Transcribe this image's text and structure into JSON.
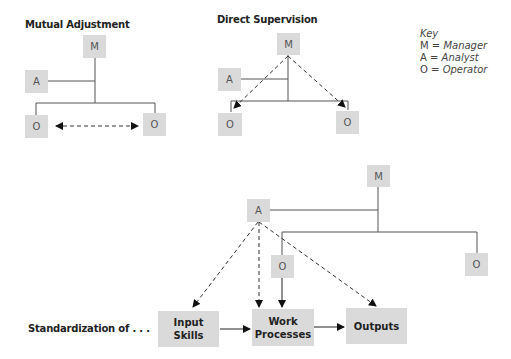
{
  "panels": {
    "mutual_adjustment": {
      "title": "Mutual Adjustment",
      "nodes": {
        "manager": "M",
        "analyst": "A",
        "operator_left": "O",
        "operator_right": "O"
      }
    },
    "direct_supervision": {
      "title": "Direct Supervision",
      "nodes": {
        "manager": "M",
        "analyst": "A",
        "operator_left": "O",
        "operator_right": "O"
      }
    },
    "standardization": {
      "label": "Standardization of . . .",
      "nodes": {
        "manager": "M",
        "analyst": "A",
        "operator_left": "O",
        "operator_right": "O"
      },
      "stages": {
        "input_skills": [
          "Input",
          "Skills"
        ],
        "work_processes": [
          "Work",
          "Processes"
        ],
        "outputs": "Outputs"
      }
    }
  },
  "key": {
    "title": "Key",
    "entries": [
      {
        "symbol": "M",
        "eq": " = ",
        "meaning": "Manager"
      },
      {
        "symbol": "A",
        "eq": " = ",
        "meaning": "Analyst"
      },
      {
        "symbol": "O",
        "eq": " = ",
        "meaning": "Operator"
      }
    ]
  },
  "colors": {
    "box_fill": "#dadada",
    "line": "#555555",
    "arrow": "#111111"
  }
}
